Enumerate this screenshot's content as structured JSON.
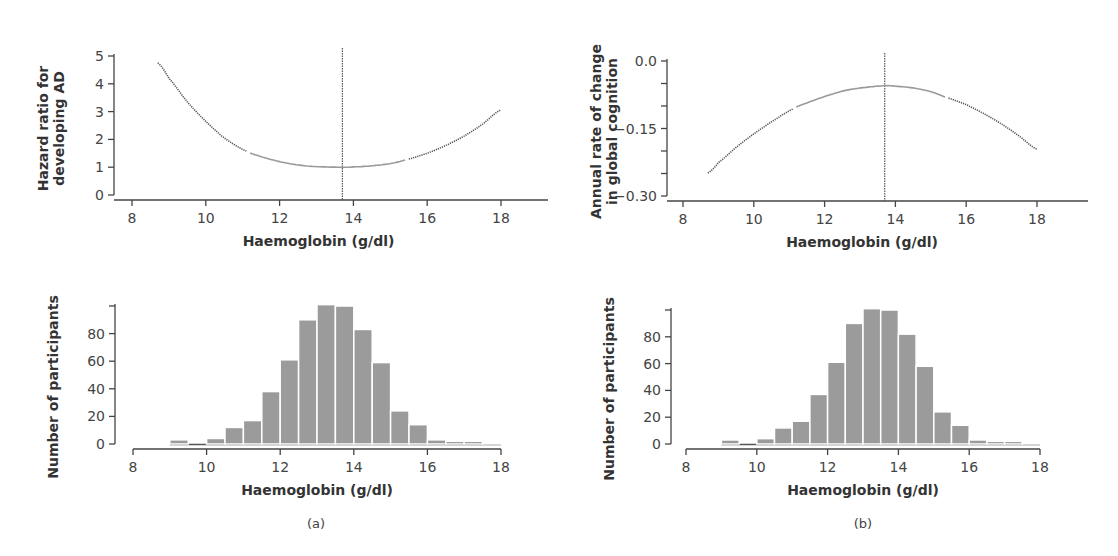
{
  "figure": {
    "panels": [
      {
        "id": "a",
        "label": "(a)"
      },
      {
        "id": "b",
        "label": "(b)"
      }
    ],
    "colors": {
      "bar_fill": "#9b9b9b",
      "curve_dotted": "#555555",
      "curve_solid": "#9a9a9a",
      "axis": "#444444"
    }
  },
  "chart_data": [
    {
      "id": "a-top",
      "type": "line",
      "title": "",
      "xlabel": "Haemoglobin (g/dl)",
      "ylabel": "Hazard ratio for developing AD",
      "ylabel_lines": [
        "Hazard ratio for",
        "developing AD"
      ],
      "xlim": [
        8,
        19.3
      ],
      "ylim": [
        0,
        5
      ],
      "xticks": [
        8,
        10,
        12,
        14,
        16,
        18
      ],
      "yticks": [
        0,
        1,
        2,
        3,
        4,
        5
      ],
      "ytick_labels": [
        "0",
        "1",
        "2",
        "3",
        "4",
        "5"
      ],
      "reference_x": 13.7,
      "grid": false,
      "series": [
        {
          "name": "Hazard ratio",
          "x": [
            8.7,
            9.0,
            9.5,
            10.0,
            10.5,
            11.1,
            11.5,
            12.0,
            12.5,
            13.0,
            13.7,
            14.0,
            14.5,
            15.0,
            15.4,
            16.0,
            16.5,
            17.0,
            17.5,
            18.0
          ],
          "y": [
            4.75,
            4.2,
            3.35,
            2.65,
            2.05,
            1.58,
            1.38,
            1.2,
            1.08,
            1.02,
            1.0,
            1.01,
            1.05,
            1.13,
            1.26,
            1.5,
            1.78,
            2.12,
            2.55,
            3.06
          ],
          "segments": [
            {
              "style": "dotted",
              "from": 8.7,
              "to": 11.1
            },
            {
              "style": "solid",
              "from": 11.2,
              "to": 15.4
            },
            {
              "style": "dotted",
              "from": 15.5,
              "to": 18.0
            }
          ]
        }
      ]
    },
    {
      "id": "b-top",
      "type": "line",
      "title": "",
      "xlabel": "Haemoglobin (g/dl)",
      "ylabel": "Annual rate of change in global cognition",
      "ylabel_lines": [
        "Annual rate of change",
        "in global cognition"
      ],
      "xlim": [
        8,
        19.4
      ],
      "ylim": [
        -0.3,
        0.0
      ],
      "xticks": [
        8,
        10,
        12,
        14,
        16,
        18
      ],
      "yticks": [
        -0.3,
        -0.25,
        -0.2,
        -0.15,
        -0.1,
        -0.05,
        0.0
      ],
      "ytick_labels": [
        "−0.30",
        "",
        "",
        "−0.15",
        "",
        "",
        "0.0"
      ],
      "reference_x": 13.7,
      "grid": false,
      "series": [
        {
          "name": "Annual rate of change",
          "x": [
            8.7,
            9.0,
            9.5,
            10.0,
            10.5,
            11.1,
            11.5,
            12.0,
            12.5,
            13.0,
            13.7,
            14.0,
            14.5,
            15.0,
            15.4,
            16.0,
            16.5,
            17.0,
            17.5,
            18.0
          ],
          "y": [
            -0.249,
            -0.226,
            -0.192,
            -0.162,
            -0.135,
            -0.107,
            -0.093,
            -0.079,
            -0.067,
            -0.06,
            -0.055,
            -0.056,
            -0.06,
            -0.068,
            -0.08,
            -0.097,
            -0.117,
            -0.14,
            -0.167,
            -0.196
          ],
          "segments": [
            {
              "style": "dotted",
              "from": 8.7,
              "to": 11.1
            },
            {
              "style": "solid",
              "from": 11.2,
              "to": 15.4
            },
            {
              "style": "dotted",
              "from": 15.5,
              "to": 18.0
            }
          ]
        }
      ]
    },
    {
      "id": "a-bottom",
      "type": "bar",
      "title": "",
      "xlabel": "Haemoglobin (g/dl)",
      "ylabel": "Number of participants",
      "xlim": [
        8,
        18
      ],
      "ylim": [
        0,
        100
      ],
      "xticks": [
        8,
        10,
        12,
        14,
        16,
        18
      ],
      "yticks": [
        0,
        20,
        40,
        60,
        80,
        100
      ],
      "ytick_labels": [
        "0",
        "20",
        "40",
        "60",
        "80",
        ""
      ],
      "grid": false,
      "bin_width": 0.5,
      "categories": [
        "9.0-9.5",
        "9.5-10.0",
        "10.0-10.5",
        "10.5-11.0",
        "11.0-11.5",
        "11.5-12.0",
        "12.0-12.5",
        "12.5-13.0",
        "13.0-13.5",
        "13.5-14.0",
        "14.0-14.5",
        "14.5-15.0",
        "15.0-15.5",
        "15.5-16.0",
        "16.0-16.5",
        "16.5-17.0",
        "17.0-17.5",
        "17.5-18.0"
      ],
      "bin_starts": [
        9.0,
        9.5,
        10.0,
        10.5,
        11.0,
        11.5,
        12.0,
        12.5,
        13.0,
        13.5,
        14.0,
        14.5,
        15.0,
        15.5,
        16.0,
        16.5,
        17.0,
        17.5
      ],
      "values": [
        3,
        0,
        4,
        12,
        17,
        38,
        61,
        90,
        101,
        100,
        83,
        59,
        24,
        14,
        3,
        2,
        2,
        1
      ]
    },
    {
      "id": "b-bottom",
      "type": "bar",
      "title": "",
      "xlabel": "Haemoglobin (g/dl)",
      "ylabel": "Number of participants",
      "xlim": [
        8,
        18
      ],
      "ylim": [
        0,
        100
      ],
      "xticks": [
        8,
        10,
        12,
        14,
        16,
        18
      ],
      "yticks": [
        0,
        20,
        40,
        60,
        80,
        100
      ],
      "ytick_labels": [
        "0",
        "20",
        "40",
        "60",
        "80",
        ""
      ],
      "grid": false,
      "bin_width": 0.5,
      "categories": [
        "9.0-9.5",
        "9.5-10.0",
        "10.0-10.5",
        "10.5-11.0",
        "11.0-11.5",
        "11.5-12.0",
        "12.0-12.5",
        "12.5-13.0",
        "13.0-13.5",
        "13.5-14.0",
        "14.0-14.5",
        "14.5-15.0",
        "15.0-15.5",
        "15.5-16.0",
        "16.0-16.5",
        "16.5-17.0",
        "17.0-17.5",
        "17.5-18.0"
      ],
      "bin_starts": [
        9.0,
        9.5,
        10.0,
        10.5,
        11.0,
        11.5,
        12.0,
        12.5,
        13.0,
        13.5,
        14.0,
        14.5,
        15.0,
        15.5,
        16.0,
        16.5,
        17.0,
        17.5
      ],
      "values": [
        3,
        0,
        4,
        12,
        17,
        37,
        61,
        90,
        101,
        100,
        82,
        58,
        24,
        14,
        3,
        2,
        2,
        1
      ]
    }
  ]
}
